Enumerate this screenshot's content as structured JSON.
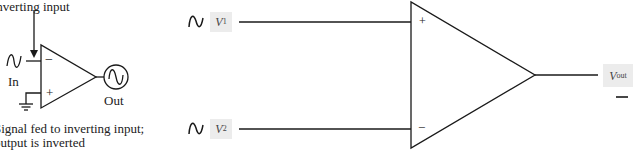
{
  "left_diagram": {
    "top_label": "Inverting input",
    "input_label": "In",
    "output_label": "Out",
    "caption_line1": "Signal fed to inverting input;",
    "caption_line2": "output is inverted",
    "minus_sign": "−",
    "plus_sign": "+"
  },
  "right_diagram": {
    "v1": {
      "symbol": "V",
      "sub": "1"
    },
    "v2": {
      "symbol": "V",
      "sub": "2"
    },
    "vout": {
      "symbol": "V",
      "sub": "out"
    },
    "plus_sign": "+",
    "minus_sign": "−",
    "label_bg_color": "#ececec"
  },
  "colors": {
    "line": "#1a1a1a",
    "text": "#222222"
  }
}
